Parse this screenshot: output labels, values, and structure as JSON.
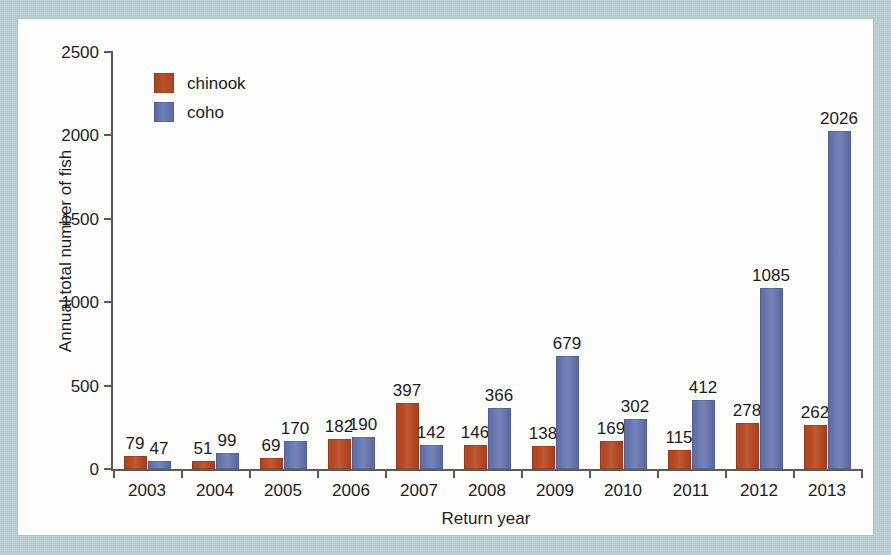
{
  "figure": {
    "background_color": "#b9ced2",
    "panel_color": "#fdfdfb"
  },
  "legend": {
    "position": "top-left inside plot",
    "entries": [
      {
        "label": "chinook",
        "color": "#b0482a"
      },
      {
        "label": "coho",
        "color": "#6474a9"
      }
    ]
  },
  "chart_data": {
    "type": "bar",
    "title": "",
    "xlabel": "Return year",
    "ylabel": "Annual total number of fish",
    "categories": [
      "2003",
      "2004",
      "2005",
      "2006",
      "2007",
      "2008",
      "2009",
      "2010",
      "2011",
      "2012",
      "2013"
    ],
    "series": [
      {
        "name": "chinook",
        "color": "#b0482a",
        "values": [
          79,
          51,
          69,
          182,
          397,
          146,
          138,
          169,
          115,
          278,
          262
        ]
      },
      {
        "name": "coho",
        "color": "#6474a9",
        "values": [
          47,
          99,
          170,
          190,
          142,
          366,
          679,
          302,
          412,
          1085,
          2026
        ]
      }
    ],
    "ylim": [
      0,
      2500
    ],
    "yticks": [
      0,
      500,
      1000,
      1500,
      2000,
      2500
    ],
    "ytick_labels": [
      "0",
      "500",
      "1000",
      "1500",
      "2000",
      "2500"
    ],
    "grid": false,
    "data_labels": true,
    "legend_position": "upper left"
  }
}
